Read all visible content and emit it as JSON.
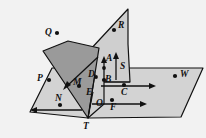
{
  "figure": {
    "canvas": {
      "width": 206,
      "height": 138
    },
    "background_color": "#f2f2f2",
    "stroke_color": "#111111",
    "planes": [
      {
        "name": "horizontal-plane",
        "fill": "#d3d3d3",
        "points_on_plane": [
          "P",
          "N",
          "O",
          "F",
          "C",
          "W",
          "T"
        ]
      },
      {
        "name": "vertical-plane",
        "fill": "#cfcfcf",
        "points_on_plane": [
          "R",
          "A",
          "D",
          "B",
          "S",
          "E",
          "T"
        ]
      },
      {
        "name": "slanted-plane",
        "fill": "#9a9a9a",
        "points_on_plane": [
          "Q",
          "M",
          "T"
        ]
      }
    ],
    "points": [
      {
        "id": "Q",
        "label": "Q",
        "dot_x": 57,
        "dot_y": 33,
        "label_x": 45,
        "label_y": 28,
        "has_dot": true
      },
      {
        "id": "R",
        "label": "R",
        "dot_x": 114,
        "dot_y": 30,
        "label_x": 118,
        "label_y": 21,
        "has_dot": true
      },
      {
        "id": "P",
        "label": "P",
        "dot_x": 49,
        "dot_y": 80,
        "label_x": 37,
        "label_y": 74,
        "has_dot": true
      },
      {
        "id": "A",
        "label": "A",
        "dot_x": 105,
        "dot_y": 68,
        "label_x": 106,
        "label_y": 54,
        "has_dot": false
      },
      {
        "id": "S",
        "label": "S",
        "dot_x": 121,
        "dot_y": 66,
        "label_x": 120,
        "label_y": 62,
        "has_dot": false
      },
      {
        "id": "W",
        "label": "W",
        "dot_x": 175,
        "dot_y": 76,
        "label_x": 180,
        "label_y": 70,
        "has_dot": true
      },
      {
        "id": "M",
        "label": "M",
        "dot_x": 79,
        "dot_y": 86,
        "label_x": 75,
        "label_y": 77,
        "has_dot": true
      },
      {
        "id": "D",
        "label": "D",
        "dot_x": 95,
        "dot_y": 74,
        "label_x": 90,
        "label_y": 69,
        "has_dot": false
      },
      {
        "id": "B",
        "label": "B",
        "dot_x": 104,
        "dot_y": 80,
        "label_x": 104,
        "label_y": 75,
        "has_dot": true
      },
      {
        "id": "C",
        "label": "C",
        "dot_x": 124,
        "dot_y": 85,
        "label_x": 122,
        "label_y": 88,
        "has_dot": true
      },
      {
        "id": "E",
        "label": "E",
        "dot_x": 93,
        "dot_y": 92,
        "label_x": 88,
        "label_y": 87,
        "has_dot": false
      },
      {
        "id": "N",
        "label": "N",
        "dot_x": 60,
        "dot_y": 105,
        "label_x": 56,
        "label_y": 95,
        "has_dot": true
      },
      {
        "id": "O",
        "label": "O",
        "dot_x": 93,
        "dot_y": 104,
        "label_x": 96,
        "label_y": 100,
        "has_dot": false
      },
      {
        "id": "F",
        "label": "F",
        "dot_x": 112,
        "dot_y": 100,
        "label_x": 110,
        "label_y": 103,
        "has_dot": true
      },
      {
        "id": "T",
        "label": "T",
        "dot_x": 88,
        "dot_y": 118,
        "label_x": 83,
        "label_y": 121,
        "has_dot": false
      }
    ],
    "rays": [
      {
        "name": "ray-N-left",
        "from": [
          82,
          110
        ],
        "to": [
          31,
          110
        ],
        "through": "N",
        "direction": "left"
      },
      {
        "name": "ray-F-right",
        "from": [
          92,
          104
        ],
        "to": [
          146,
          104
        ],
        "through": "F",
        "direction": "right"
      },
      {
        "name": "ray-C-right",
        "from": [
          101,
          86
        ],
        "to": [
          155,
          86
        ],
        "through": "C",
        "direction": "right"
      },
      {
        "name": "ray-M-downleft",
        "from": [
          97,
          58
        ],
        "to": [
          63,
          89
        ],
        "through": "M",
        "direction": "down-left"
      },
      {
        "name": "ray-B-up",
        "from": [
          104,
          81
        ],
        "to": [
          104,
          57
        ],
        "through": "A",
        "direction": "up"
      },
      {
        "name": "ray-S-up",
        "from": [
          116,
          80
        ],
        "to": [
          116,
          52
        ],
        "through": "S",
        "direction": "up"
      }
    ]
  }
}
